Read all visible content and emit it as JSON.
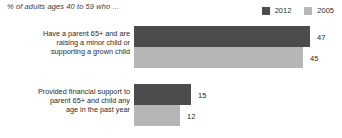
{
  "header": {
    "subtitle": "% of adults ages 40 to 59 who ..."
  },
  "legend": {
    "position": "top-right",
    "entries": [
      {
        "label": "2012",
        "color": "#4c4c4c",
        "swatch_name": "legend-swatch-2012"
      },
      {
        "label": "2005",
        "color": "#b6b6b6",
        "swatch_name": "legend-swatch-2005"
      }
    ]
  },
  "chart_data": {
    "type": "bar",
    "orientation": "horizontal",
    "title": "",
    "subtitle": "% of adults ages 40 to 59 who ...",
    "xlabel": "",
    "ylabel": "",
    "grid": false,
    "legend_position": "top-right",
    "xlim": [
      0,
      55
    ],
    "categories": [
      "Have a parent 65+ and are raising a minor child or supporting a grown child",
      "Provided financial support to parent 65+ and child any age in the past year"
    ],
    "series": [
      {
        "name": "2012",
        "color": "#4c4c4c",
        "values": [
          47,
          15
        ]
      },
      {
        "name": "2005",
        "color": "#b6b6b6",
        "values": [
          45,
          12
        ]
      }
    ]
  },
  "groups": [
    {
      "label_lines": [
        "Have a parent 65+ and are",
        "raising a minor child or",
        "supporting a grown child"
      ],
      "bars": [
        {
          "series": "2012",
          "value": 47,
          "value_label": "47",
          "color": "#4c4c4c",
          "width_px": 176
        },
        {
          "series": "2005",
          "value": 45,
          "value_label": "45",
          "color": "#b6b6b6",
          "width_px": 169
        }
      ]
    },
    {
      "label_lines": [
        "Provided financial support to",
        "parent 65+ and child any",
        "age in the past year"
      ],
      "bars": [
        {
          "series": "2012",
          "value": 15,
          "value_label": "15",
          "color": "#4c4c4c",
          "width_px": 57
        },
        {
          "series": "2005",
          "value": 12,
          "value_label": "12",
          "color": "#b6b6b6",
          "width_px": 46
        }
      ]
    }
  ]
}
